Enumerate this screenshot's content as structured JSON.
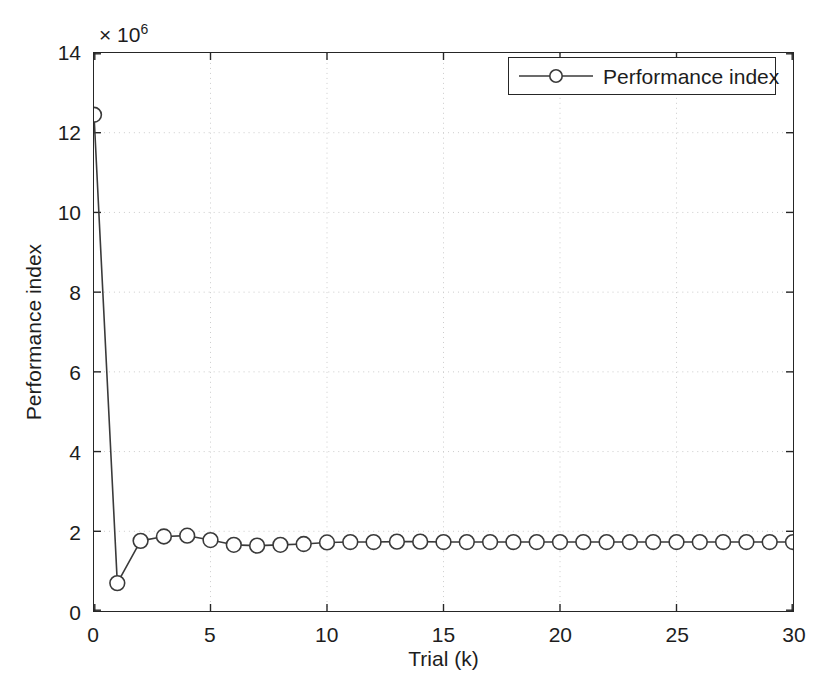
{
  "chart_data": {
    "type": "line",
    "title": "",
    "subtitle": "",
    "xlabel": "Trial (k)",
    "ylabel": "Performance index",
    "y_multiplier_prefix": "× 10",
    "y_multiplier_exponent": "6",
    "y_scale_factor": 1000000,
    "xlim": [
      0,
      30
    ],
    "ylim": [
      0,
      14
    ],
    "xticks": [
      0,
      5,
      10,
      15,
      20,
      25,
      30
    ],
    "yticks": [
      0,
      2,
      4,
      6,
      8,
      10,
      12,
      14
    ],
    "xtick_labels": [
      "0",
      "5",
      "10",
      "15",
      "20",
      "25",
      "30"
    ],
    "ytick_labels": [
      "0",
      "2",
      "4",
      "6",
      "8",
      "10",
      "12",
      "14"
    ],
    "grid": true,
    "grid_style": "dotted",
    "grid_color": "#cccccc",
    "legend": {
      "position": "top-right",
      "entries": [
        {
          "label": "Performance index",
          "marker": "circle-open",
          "line_style": "solid",
          "color": "#3a3a3a"
        }
      ]
    },
    "series": [
      {
        "name": "Performance index",
        "marker": "circle-open",
        "color": "#3a3a3a",
        "x": [
          0,
          1,
          2,
          3,
          4,
          5,
          6,
          7,
          8,
          9,
          10,
          11,
          12,
          13,
          14,
          15,
          16,
          17,
          18,
          19,
          20,
          21,
          22,
          23,
          24,
          25,
          26,
          27,
          28,
          29,
          30
        ],
        "values": [
          12.45,
          0.7,
          1.76,
          1.87,
          1.89,
          1.78,
          1.66,
          1.64,
          1.66,
          1.68,
          1.72,
          1.73,
          1.73,
          1.74,
          1.74,
          1.73,
          1.73,
          1.73,
          1.73,
          1.73,
          1.73,
          1.73,
          1.73,
          1.73,
          1.73,
          1.73,
          1.73,
          1.73,
          1.73,
          1.73,
          1.73
        ]
      }
    ]
  }
}
